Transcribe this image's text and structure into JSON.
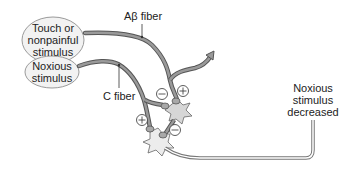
{
  "diagram": {
    "stimuli": {
      "touch": {
        "line1": "Touch or",
        "line2": "nonpainful",
        "line3": "stimulus"
      },
      "noxious": {
        "line1": "Noxious",
        "line2": "stimulus"
      }
    },
    "fibers": {
      "a_beta": "Aβ fiber",
      "c": "C fiber"
    },
    "signs": {
      "plus": "+",
      "minus": "−"
    },
    "output": {
      "line1": "Noxious",
      "line2": "stimulus",
      "line3": "decreased"
    },
    "colors": {
      "fiber_outline": "#555555",
      "fiber_fill": "#9a9a9a",
      "neuron_fill": "#e8e8e8",
      "terminal_fill": "#a8a8a8",
      "oval_fill": "#f2f2f2",
      "oval_stroke": "#999999"
    }
  }
}
